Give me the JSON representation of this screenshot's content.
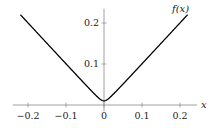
{
  "chart_data": {
    "type": "line",
    "title": "",
    "xlabel": "x",
    "ylabel": "",
    "legend": [],
    "series": [
      {
        "name": "f(x)",
        "label": "f(x)",
        "description": "smooth absolute value, approx sqrt(x^2 + 0.01^2)",
        "x": [
          -0.22,
          -0.2,
          -0.15,
          -0.1,
          -0.05,
          -0.02,
          -0.01,
          0,
          0.01,
          0.02,
          0.05,
          0.1,
          0.15,
          0.2,
          0.22
        ],
        "y": [
          0.2202,
          0.2002,
          0.1503,
          0.1005,
          0.051,
          0.0224,
          0.0141,
          0.01,
          0.0141,
          0.0224,
          0.051,
          0.1005,
          0.1503,
          0.2002,
          0.2202
        ],
        "color": "#000000"
      }
    ],
    "x_ticks": [
      -0.2,
      -0.1,
      0,
      0.1,
      0.2
    ],
    "x_tick_labels": [
      "−0.2",
      "−0.1",
      "0",
      "0.1",
      "0.2"
    ],
    "y_ticks": [
      0.1,
      0.2
    ],
    "y_tick_labels": [
      "0.1",
      "0.2"
    ],
    "xlim": [
      -0.24,
      0.245
    ],
    "ylim": [
      -0.015,
      0.235
    ],
    "grid": false,
    "axis_style": "middle"
  }
}
